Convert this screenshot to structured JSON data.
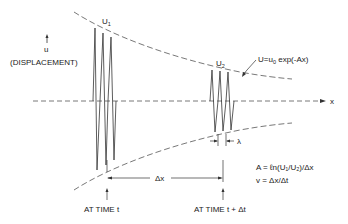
{
  "diagram": {
    "type": "decaying-wave-propagation",
    "axis": {
      "vertical_label": "u",
      "vertical_desc": "(DISPLACEMENT)",
      "horizontal_label": "x"
    },
    "wave1": {
      "label": "U",
      "sub": "1",
      "time_label": "AT TIME t"
    },
    "wave2": {
      "label": "U",
      "sub": "2",
      "time_label": "AT TIME t + Δt"
    },
    "envelope": {
      "equation_prefix": "U=u",
      "equation_sub": "0",
      "equation_suffix": " exp(-Αx)"
    },
    "wavelength_label": "λ",
    "distance_label": "Δx",
    "formulas": {
      "attenuation": "Α = ℓn(U₁/U₂)/Δx",
      "velocity": "v = Δx/Δt"
    },
    "colors": {
      "line": "#333333",
      "dashed": "#555555",
      "background": "#ffffff"
    }
  }
}
